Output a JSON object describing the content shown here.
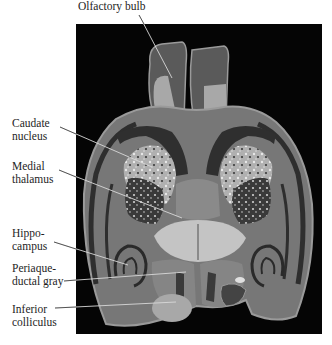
{
  "figure": {
    "type": "annotated brain MRI section (horizontal)",
    "labels": [
      {
        "id": "olfactory-bulb",
        "text": "Olfactory bulb"
      },
      {
        "id": "caudate-nucleus",
        "text": "Caudate\nnucleus"
      },
      {
        "id": "medial-thalamus",
        "text": "Medial\nthalamus"
      },
      {
        "id": "hippocampus",
        "text": "Hippo-\ncampus"
      },
      {
        "id": "periaqueductal-gray",
        "text": "Periaque-\nductal gray"
      },
      {
        "id": "inferior-colliculus",
        "text": "Inferior\ncolliculus"
      }
    ],
    "colors": {
      "background": "#ffffff",
      "panel": "#050505",
      "tissue_gray": "#7a7a7a",
      "tissue_light": "#b8b8b8",
      "tissue_dark": "#2e2e2e",
      "leader_line": "#d8d8d8"
    }
  }
}
